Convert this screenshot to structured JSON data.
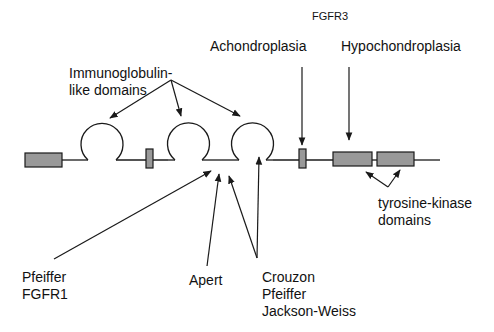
{
  "title": "FGFR3",
  "labels": {
    "ig_domains": [
      "Immunoglobulin-",
      "like domains"
    ],
    "achondroplasia": "Achondroplasia",
    "hypochondroplasia": "Hypochondroplasia",
    "tk_domains": [
      "tyrosine-kinase",
      "domains"
    ],
    "pfeiffer_fgfr1": [
      "Pfeiffer",
      "FGFR1"
    ],
    "apert": "Apert",
    "crouzon_group": [
      "Crouzon",
      "Pfeiffer",
      "Jackson-Weiss"
    ]
  },
  "colors": {
    "line": "#1a1a1a",
    "box_fill": "#999999",
    "text": "#111111"
  }
}
